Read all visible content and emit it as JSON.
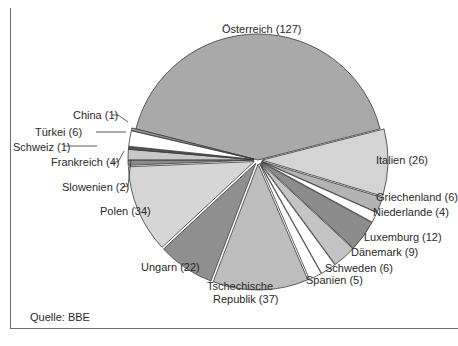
{
  "chart_data": {
    "type": "pie",
    "title": "",
    "exploded": true,
    "total": 302,
    "slices": [
      {
        "label": "Österreich",
        "value": 127,
        "color": "#a9a9a9",
        "display": "Österreich (127)"
      },
      {
        "label": "Italien",
        "value": 26,
        "color": "#d4d4d4",
        "display": "Italien (26)"
      },
      {
        "label": "Griechenland",
        "value": 6,
        "color": "#b3b3b3",
        "display": "Griechenland (6)"
      },
      {
        "label": "Niederlande",
        "value": 4,
        "color": "#ffffff",
        "display": "Niederlande (4)"
      },
      {
        "label": "Luxemburg",
        "value": 12,
        "color": "#8c8c8c",
        "display": "Luxemburg (12)"
      },
      {
        "label": "Dänemark",
        "value": 9,
        "color": "#c4c4c4",
        "display": "Dänemark (9)"
      },
      {
        "label": "Schweden",
        "value": 6,
        "color": "#ffffff",
        "display": "Schweden (6)"
      },
      {
        "label": "Spanien",
        "value": 5,
        "color": "#ffffff",
        "display": "Spanien (5)"
      },
      {
        "label": "Tschechische Republik",
        "value": 37,
        "color": "#bdbdbd",
        "display": "Tschechische Republik (37)"
      },
      {
        "label": "Ungarn",
        "value": 22,
        "color": "#8f8f8f",
        "display": "Ungarn (22)"
      },
      {
        "label": "Polen",
        "value": 34,
        "color": "#d6d6d6",
        "display": "Polen (34)"
      },
      {
        "label": "Slowenien",
        "value": 2,
        "color": "#8a8a8a",
        "display": "Slowenien (2)"
      },
      {
        "label": "Frankreich",
        "value": 4,
        "color": "#c8c8c8",
        "display": "Frankreich (4)"
      },
      {
        "label": "Schweiz",
        "value": 1,
        "color": "#555555",
        "display": "Schweiz (1)"
      },
      {
        "label": "Türkei",
        "value": 6,
        "color": "#ffffff",
        "display": "Türkei (6)"
      },
      {
        "label": "China",
        "value": 1,
        "color": "#9a9a9a",
        "display": "China (1)"
      }
    ],
    "legend": "none (labels placed beside slices)",
    "source": "Quelle: BBE"
  },
  "labels": {
    "oesterreich": "Österreich (127)",
    "italien": "Italien (26)",
    "griechenland": "Griechenland (6)",
    "niederlande": "Niederlande (4)",
    "luxemburg": "Luxemburg (12)",
    "daenemark": "Dänemark (9)",
    "schweden": "Schweden (6)",
    "spanien": "Spanien (5)",
    "tschechien_1": "Tschechische",
    "tschechien_2": "Republik (37)",
    "ungarn": "Ungarn (22)",
    "polen": "Polen (34)",
    "slowenien": "Slowenien (2)",
    "frankreich": "Frankreich (4)",
    "schweiz": "Schweiz (1)",
    "tuerkei": "Türkei (6)",
    "china": "China (1)"
  },
  "source_note": "Quelle: BBE"
}
